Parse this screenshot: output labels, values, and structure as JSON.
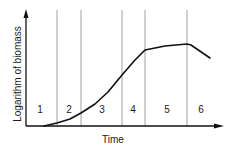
{
  "chart_data": {
    "type": "line",
    "title": "",
    "xlabel": "Time",
    "ylabel": "Logarithm of biomass",
    "phases": [
      {
        "label": "1",
        "x_start": 26,
        "x_end": 57,
        "label_x": 40
      },
      {
        "label": "2",
        "x_start": 57,
        "x_end": 81,
        "label_x": 69
      },
      {
        "label": "3",
        "x_start": 81,
        "x_end": 122,
        "label_x": 102
      },
      {
        "label": "4",
        "x_start": 122,
        "x_end": 145,
        "label_x": 133
      },
      {
        "label": "5",
        "x_start": 145,
        "x_end": 187,
        "label_x": 167
      },
      {
        "label": "6",
        "x_start": 187,
        "x_end": 222,
        "label_x": 201
      }
    ],
    "phase_boundaries_px": [
      57,
      81,
      122,
      145,
      187
    ],
    "curve_points_px": [
      [
        44,
        126
      ],
      [
        57,
        123
      ],
      [
        70,
        119
      ],
      [
        81,
        113
      ],
      [
        95,
        104
      ],
      [
        108,
        92
      ],
      [
        122,
        75
      ],
      [
        135,
        60
      ],
      [
        145,
        50
      ],
      [
        165,
        46
      ],
      [
        187,
        44
      ],
      [
        191,
        45
      ],
      [
        210,
        58
      ]
    ],
    "grid": false,
    "legend": null
  },
  "colors": {
    "axis": "#111111",
    "curve": "#111111",
    "divider": "#888888",
    "text": "#1a1a1a"
  }
}
